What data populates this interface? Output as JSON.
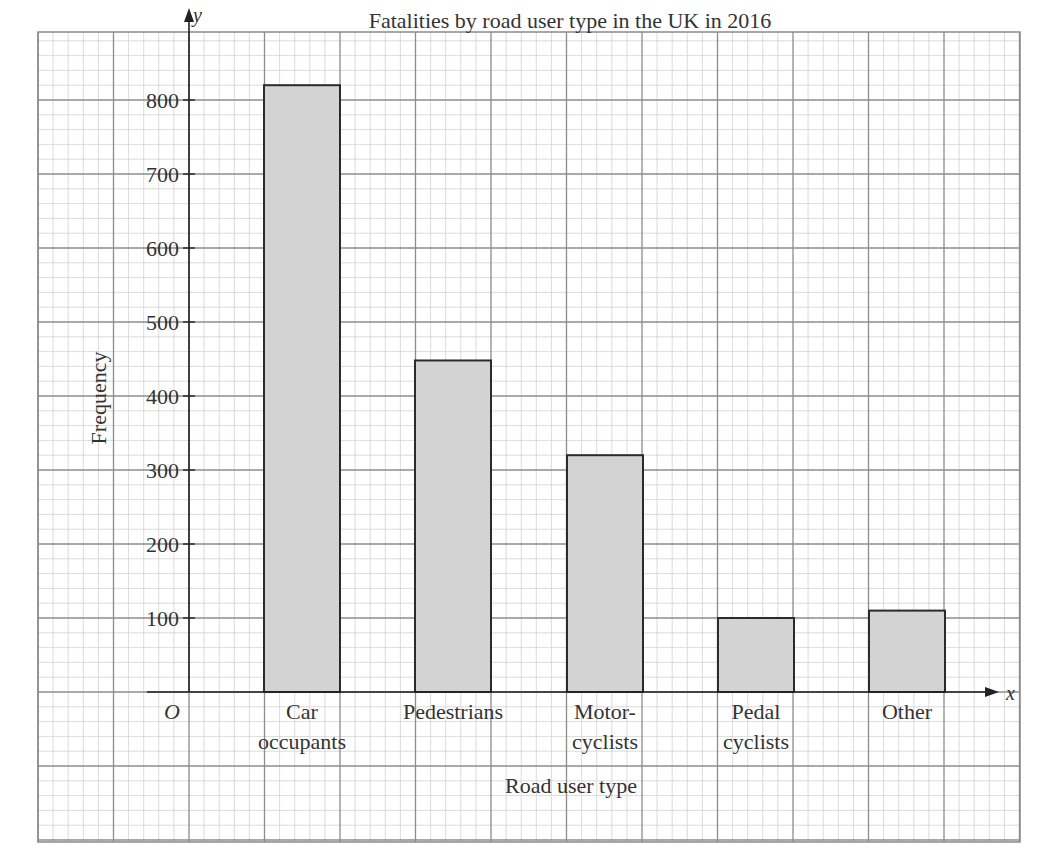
{
  "chart_data": {
    "type": "bar",
    "title": "Fatalities by road user type in the UK in 2016",
    "xlabel": "Road user type",
    "ylabel": "Frequency",
    "x_axis_symbol": "x",
    "y_axis_symbol": "y",
    "origin_label": "O",
    "categories": [
      "Car occupants",
      "Pedestrians",
      "Motorcyclists",
      "Pedal cyclists",
      "Other"
    ],
    "category_label_lines": [
      [
        "Car",
        "occupants"
      ],
      [
        "Pedestrians"
      ],
      [
        "Motor-",
        "cyclists"
      ],
      [
        "Pedal",
        "cyclists"
      ],
      [
        "Other"
      ]
    ],
    "values": [
      820,
      448,
      320,
      100,
      110
    ],
    "yticks": [
      100,
      200,
      300,
      400,
      500,
      600,
      700,
      800
    ],
    "ylim": [
      0,
      800
    ],
    "grid": true,
    "grid_style": "graph paper (major + minor)",
    "bar_fill": "#d3d3d3",
    "bar_edge": "#2b2b2b",
    "legend": null
  }
}
